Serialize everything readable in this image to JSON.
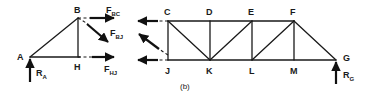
{
  "figure": {
    "caption": "(b)",
    "width": 374,
    "height": 93,
    "stroke_color": "#1a1a1a",
    "background_color": "#ffffff"
  },
  "left_body": {
    "name": "left-free-body",
    "joints": [
      {
        "label": "A",
        "x": 30,
        "y": 57
      },
      {
        "label": "B",
        "x": 78,
        "y": 18
      },
      {
        "label": "H",
        "x": 78,
        "y": 57
      }
    ],
    "joint_labels": [
      {
        "label": "A",
        "x": 17,
        "y": 56
      },
      {
        "label": "B",
        "x": 75,
        "y": 13
      },
      {
        "label": "H",
        "x": 75,
        "y": 70
      }
    ],
    "members": [
      {
        "from": "A",
        "to": "B"
      },
      {
        "from": "B",
        "to": "H"
      },
      {
        "from": "A",
        "to": "H"
      }
    ],
    "reaction": {
      "label": "R",
      "subscript": "A",
      "x": 30,
      "y_tail": 82,
      "y_head": 58,
      "label_x": 37,
      "label_y": 74
    },
    "cut_forces": [
      {
        "label": "F",
        "subscript": "BC",
        "x_tail": 84,
        "y_tail": 18,
        "x_head": 115,
        "y_head": 18,
        "label_x": 112,
        "label_y": 12,
        "direction": "right"
      },
      {
        "label": "F",
        "subscript": "BJ",
        "x_tail": 84,
        "y_tail": 27,
        "x_head": 110,
        "y_head": 45,
        "label_x": 114,
        "label_y": 35,
        "direction": "down-right"
      },
      {
        "label": "F",
        "subscript": "HJ",
        "x_tail": 84,
        "y_tail": 57,
        "x_head": 115,
        "y_head": 57,
        "label_x": 110,
        "label_y": 71,
        "direction": "right"
      }
    ]
  },
  "right_body": {
    "name": "right-free-body",
    "top_joints": [
      {
        "label": "C",
        "x": 168,
        "y": 21
      },
      {
        "label": "D",
        "x": 210,
        "y": 21
      },
      {
        "label": "E",
        "x": 252,
        "y": 21
      },
      {
        "label": "F",
        "x": 294,
        "y": 21
      }
    ],
    "bottom_joints": [
      {
        "label": "J",
        "x": 168,
        "y": 60
      },
      {
        "label": "K",
        "x": 210,
        "y": 60
      },
      {
        "label": "L",
        "x": 252,
        "y": 60
      },
      {
        "label": "M",
        "x": 294,
        "y": 60
      },
      {
        "label": "G",
        "x": 336,
        "y": 60
      }
    ],
    "top_labels": [
      {
        "label": "C",
        "x": 164,
        "y": 15
      },
      {
        "label": "D",
        "x": 206,
        "y": 15
      },
      {
        "label": "E",
        "x": 248,
        "y": 15
      },
      {
        "label": "F",
        "x": 290,
        "y": 15
      }
    ],
    "bottom_labels": [
      {
        "label": "J",
        "x": 165,
        "y": 73
      },
      {
        "label": "K",
        "x": 206,
        "y": 73
      },
      {
        "label": "L",
        "x": 249,
        "y": 73
      },
      {
        "label": "M",
        "x": 290,
        "y": 73
      },
      {
        "label": "G",
        "x": 343,
        "y": 59
      }
    ],
    "chords": [
      {
        "name": "top-chord",
        "x1": 168,
        "y1": 21,
        "x2": 294,
        "y2": 21
      },
      {
        "name": "bottom-chord",
        "x1": 168,
        "y1": 60,
        "x2": 336,
        "y2": 60
      }
    ],
    "verticals": [
      {
        "from": "C",
        "to": "J"
      },
      {
        "from": "D",
        "to": "K"
      },
      {
        "from": "E",
        "to": "L"
      },
      {
        "from": "F",
        "to": "M"
      }
    ],
    "diagonals": [
      {
        "from": "C",
        "to": "K"
      },
      {
        "from": "K",
        "to": "E"
      },
      {
        "from": "L",
        "to": "F"
      },
      {
        "from": "F",
        "to": "G"
      }
    ],
    "reaction": {
      "label": "R",
      "subscript": "G",
      "x": 336,
      "y_tail": 84,
      "y_head": 61,
      "label_x": 343,
      "label_y": 76
    },
    "cut_forces": [
      {
        "label": "F_BC-reaction",
        "x_tail": 166,
        "y_tail": 21,
        "x_head": 137,
        "y_head": 21,
        "direction": "left"
      },
      {
        "label": "F_BJ-reaction",
        "x_tail": 164,
        "y_tail": 50,
        "x_head": 137,
        "y_head": 33,
        "direction": "up-left"
      },
      {
        "label": "F_HJ-reaction",
        "x_tail": 166,
        "y_tail": 60,
        "x_head": 137,
        "y_head": 60,
        "direction": "left"
      }
    ]
  }
}
